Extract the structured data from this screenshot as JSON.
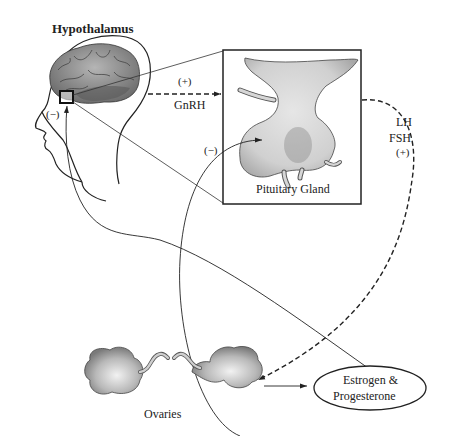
{
  "diagram": {
    "type": "hormonal feedback loop",
    "nodes": {
      "hypothalamus": {
        "label": "Hypothalamus"
      },
      "pituitary": {
        "label": "Pituitary Gland"
      },
      "ovaries": {
        "label": "Ovaries"
      },
      "hormones": {
        "label_line1": "Estrogen &",
        "label_line2": "Progesterone"
      }
    },
    "edges": {
      "gnrh": {
        "sign": "(+)",
        "label": "GnRH",
        "from": "hypothalamus",
        "to": "pituitary",
        "style": "dashed"
      },
      "lh_fsh": {
        "label_line1": "LH",
        "label_line2": "FSH",
        "sign": "(+)",
        "from": "pituitary",
        "to": "ovaries",
        "style": "dashed"
      },
      "ovaries_to_hormones": {
        "from": "ovaries",
        "to": "hormones",
        "style": "solid"
      },
      "neg_hypothalamus": {
        "sign": "(−)",
        "from": "hormones",
        "to": "hypothalamus",
        "style": "solid"
      },
      "neg_pituitary": {
        "sign": "(−)",
        "from": "hormones",
        "to": "pituitary",
        "style": "solid"
      }
    },
    "colors": {
      "line": "#222222",
      "organ_fill": "#bdbdbd",
      "organ_shade": "#8a8a8a",
      "brain_fill": "#9a9a9a"
    }
  }
}
